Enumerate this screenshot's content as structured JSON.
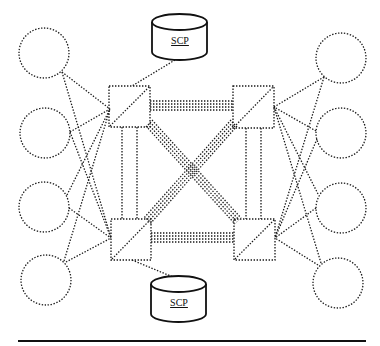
{
  "diagram": {
    "type": "network-topology",
    "colors": {
      "stroke": "#1a1a1a",
      "background": "#ffffff"
    },
    "switches": [
      {
        "id": "sw-top-left",
        "x": 109,
        "y": 86,
        "w": 41,
        "h": 41
      },
      {
        "id": "sw-top-right",
        "x": 233,
        "y": 86,
        "w": 41,
        "h": 41
      },
      {
        "id": "sw-bottom-left",
        "x": 111,
        "y": 219,
        "w": 40,
        "h": 41
      },
      {
        "id": "sw-bottom-right",
        "x": 234,
        "y": 219,
        "w": 41,
        "h": 41
      }
    ],
    "scp_nodes": [
      {
        "id": "scp-top",
        "label": "SCP",
        "x": 152,
        "y": 14,
        "w": 55,
        "h": 46
      },
      {
        "id": "scp-bottom",
        "label": "SCP",
        "x": 151,
        "y": 276,
        "w": 55,
        "h": 46
      }
    ],
    "endpoints_left": [
      {
        "id": "left-1",
        "cx": 44,
        "cy": 53,
        "r": 25
      },
      {
        "id": "left-2",
        "cx": 45,
        "cy": 133,
        "r": 25
      },
      {
        "id": "left-3",
        "cx": 44,
        "cy": 207,
        "r": 25
      },
      {
        "id": "left-4",
        "cx": 46,
        "cy": 280,
        "r": 25
      }
    ],
    "endpoints_right": [
      {
        "id": "right-1",
        "cx": 341,
        "cy": 58,
        "r": 25
      },
      {
        "id": "right-2",
        "cx": 341,
        "cy": 133,
        "r": 25
      },
      {
        "id": "right-3",
        "cx": 341,
        "cy": 208,
        "r": 25
      },
      {
        "id": "right-4",
        "cx": 338,
        "cy": 283,
        "r": 25
      }
    ],
    "labels": {
      "scp_top": "SCP",
      "scp_bottom": "SCP"
    }
  }
}
